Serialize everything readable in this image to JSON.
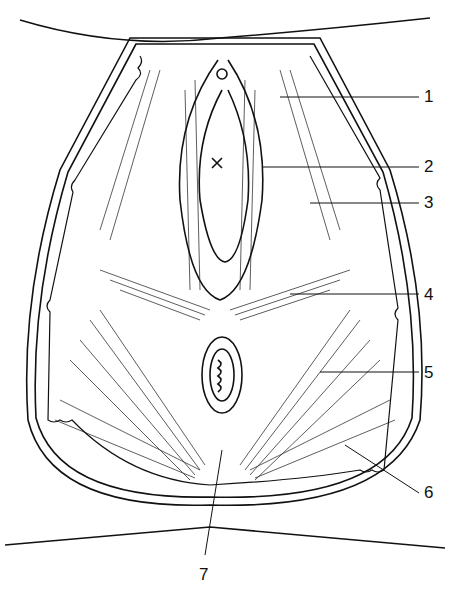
{
  "figure": {
    "labels": [
      {
        "number": "1",
        "x": 424,
        "y": 90
      },
      {
        "number": "2",
        "x": 424,
        "y": 158
      },
      {
        "number": "3",
        "x": 424,
        "y": 196
      },
      {
        "number": "4",
        "x": 424,
        "y": 287
      },
      {
        "number": "5",
        "x": 424,
        "y": 366
      },
      {
        "number": "6",
        "x": 424,
        "y": 485
      },
      {
        "number": "7",
        "x": 202,
        "y": 568
      }
    ]
  }
}
